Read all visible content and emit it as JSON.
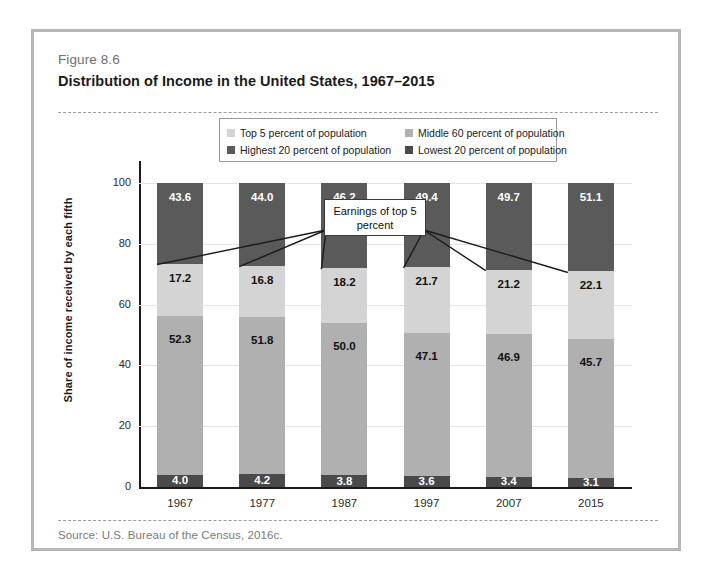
{
  "figure": {
    "number": "Figure 8.6",
    "title": "Distribution of Income in the United States, 1967–2015",
    "source": "Source: U.S. Bureau of the Census, 2016c."
  },
  "annotation": {
    "callout_text": "Earnings of top 5 percent"
  },
  "colors": {
    "top5": "#d4d4d4",
    "highest20": "#5a5a5a",
    "middle60": "#b0b0b0",
    "lowest20": "#4a4a4a",
    "card_border": "#b7b7b7",
    "axis": "#1b1b1b",
    "gridline": "#e3e3e3"
  },
  "chart_data": {
    "type": "bar",
    "title": "Distribution of Income in the United States, 1967–2015",
    "xlabel": "",
    "ylabel": "Share of income received by each fifth",
    "ylim": [
      0,
      100
    ],
    "yticks": [
      0,
      20,
      40,
      60,
      80,
      100
    ],
    "grid": true,
    "stacked": true,
    "legend_position": "top",
    "categories": [
      "1967",
      "1977",
      "1987",
      "1997",
      "2007",
      "2015"
    ],
    "series": [
      {
        "name": "Lowest 20 percent of population",
        "key": "lowest20",
        "color": "#4a4a4a",
        "label_color": "#ffffff",
        "values": [
          4.0,
          4.2,
          3.8,
          3.6,
          3.4,
          3.1
        ]
      },
      {
        "name": "Middle 60 percent of population",
        "key": "middle60",
        "color": "#b0b0b0",
        "label_color": "#111111",
        "values": [
          52.3,
          51.8,
          50.0,
          47.1,
          46.9,
          45.7
        ]
      },
      {
        "name": "Highest 20 percent of population",
        "key": "highest20",
        "color": "#5a5a5a",
        "label_color": "#ffffff",
        "values": [
          43.6,
          44.0,
          46.2,
          49.4,
          49.7,
          51.1
        ]
      },
      {
        "name": "Top 5 percent of population",
        "key": "top5",
        "color": "#d4d4d4",
        "label_color": "#111111",
        "values": [
          17.2,
          16.8,
          18.2,
          21.7,
          21.2,
          22.1
        ],
        "note": "Overlay of the top 5 percent, drawn inside the highest 20 percent band."
      }
    ],
    "annotations": [
      {
        "text": "Earnings of top 5 percent",
        "points_to": "top5"
      }
    ]
  },
  "legend": {
    "entries": [
      {
        "label": "Top 5 percent of population",
        "key": "top5"
      },
      {
        "label": "Middle 60 percent of population",
        "key": "middle60"
      },
      {
        "label": "Highest 20 percent of population",
        "key": "highest20"
      },
      {
        "label": "Lowest 20 percent of population",
        "key": "lowest20"
      }
    ]
  }
}
